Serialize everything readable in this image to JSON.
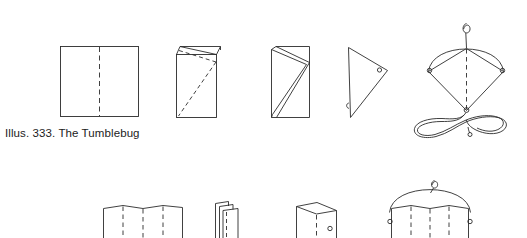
{
  "page": {
    "kind": "instructional-line-drawing",
    "background_color": "#ffffff",
    "ink_color": "#2b2b2b",
    "width": 527,
    "height": 238
  },
  "caption": {
    "text": "Illus. 333. The Tumblebug",
    "figure_number": "333",
    "title": "The Tumblebug"
  },
  "rows": [
    {
      "name": "top-row",
      "steps": [
        {
          "label": "flat-sheet-with-center-fold"
        },
        {
          "label": "folded-sheet-with-diagonal-fold-line"
        },
        {
          "label": "zigzag-folded-sheet"
        },
        {
          "label": "folded-triangle-with-hole"
        },
        {
          "label": "assembled-kite-with-tail"
        }
      ]
    },
    {
      "name": "bottom-row",
      "steps": [
        {
          "label": "accordion-pleated-sheet"
        },
        {
          "label": "compressed-pleat-stack"
        },
        {
          "label": "opened-pleat-with-hole"
        },
        {
          "label": "bowed-kite-with-bridle"
        }
      ]
    }
  ]
}
